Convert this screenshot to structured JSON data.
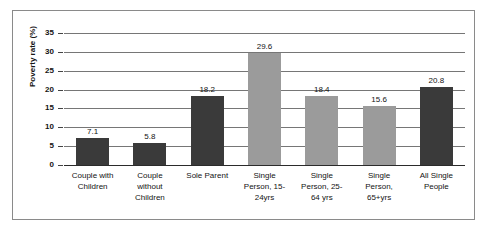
{
  "chart_data": {
    "type": "bar",
    "title": "",
    "subtitle": "",
    "xlabel": "",
    "ylabel": "Poverty rate (%)",
    "ylim": [
      0,
      35
    ],
    "ytick_step": 5,
    "yticks": [
      "0",
      "5",
      "10",
      "15",
      "20",
      "25",
      "30",
      "35"
    ],
    "grid": true,
    "legend": "none",
    "categories": [
      "Couple with Children",
      "Couple without Children",
      "Sole Parent",
      "Single Person, 15-24yrs",
      "Single Person, 25-64 yrs",
      "Single Person, 65+yrs",
      "All Single People"
    ],
    "category_lines": [
      [
        "Couple with",
        "Children"
      ],
      [
        "Couple",
        "without",
        "Children"
      ],
      [
        "Sole Parent"
      ],
      [
        "Single",
        "Person, 15-",
        "24yrs"
      ],
      [
        "Single",
        "Person, 25-",
        "64 yrs"
      ],
      [
        "Single",
        "Person,",
        "65+yrs"
      ],
      [
        "All Single",
        "People"
      ]
    ],
    "values": [
      7.1,
      5.8,
      18.2,
      29.6,
      18.4,
      15.6,
      20.8
    ],
    "value_labels": [
      "7.1",
      "5.8",
      "18.2",
      "29.6",
      "18.4",
      "15.6",
      "20.8"
    ],
    "bar_colors": [
      "#3a3a3a",
      "#3a3a3a",
      "#3a3a3a",
      "#9b9b9b",
      "#9b9b9b",
      "#9b9b9b",
      "#3a3a3a"
    ],
    "colors": {
      "dark_bar": "#3a3a3a",
      "light_bar": "#9b9b9b",
      "gridline": "#767676",
      "axis": "#2b2b2b",
      "frame": "#8a8a8a",
      "text": "#131313",
      "background": "#ffffff"
    }
  }
}
